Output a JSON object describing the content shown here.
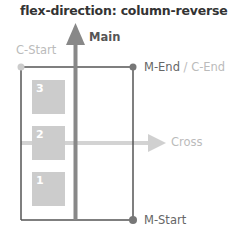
{
  "title": "flex-direction: column-reverse",
  "axes": {
    "main": {
      "label": "Main",
      "color": "#888888"
    },
    "cross": {
      "label": "Cross",
      "color": "#cccccc"
    }
  },
  "corners": {
    "c_start": "C-Start",
    "m_end": "M-End",
    "separator": " / ",
    "c_end": "C-End",
    "m_start": "M-Start"
  },
  "items": [
    {
      "label": "3"
    },
    {
      "label": "2"
    },
    {
      "label": "1"
    }
  ],
  "colors": {
    "container_border": "#555555",
    "item_fill": "#cccccc",
    "dot_dark": "#777777",
    "dot_light": "#cccccc"
  }
}
